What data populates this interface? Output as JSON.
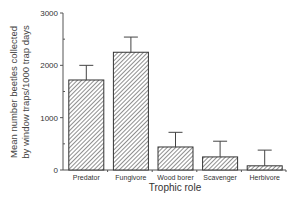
{
  "chart_data": {
    "type": "bar",
    "title": "",
    "xlabel": "Trophic role",
    "ylabel": "Mean number beetles collected by window traps/1000 trap days",
    "ylabel_lines": [
      "Mean number beetles collected",
      "by window traps/1000 trap days"
    ],
    "categories": [
      "Predator",
      "Fungivore",
      "Wood borer",
      "Scavenger",
      "Herbivore"
    ],
    "values": [
      1720,
      2250,
      440,
      250,
      80
    ],
    "error_upper": [
      2000,
      2540,
      720,
      550,
      380
    ],
    "ylim": [
      0,
      3000
    ],
    "yticks": [
      0,
      1000,
      2000,
      3000
    ],
    "yticks_minor": [
      500,
      1500,
      2500
    ],
    "grid": false,
    "legend": null,
    "bar_fill": "diagonal-hatch",
    "colors": {
      "bar_stroke": "#333333",
      "hatch": "#444444",
      "axis": "#555555",
      "text": "#333333"
    }
  }
}
